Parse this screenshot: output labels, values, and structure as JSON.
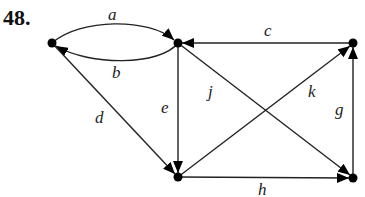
{
  "problem_number": "48.",
  "graph": {
    "type": "directed",
    "nodes": [
      {
        "id": "L",
        "x": 52,
        "y": 43
      },
      {
        "id": "TC",
        "x": 178,
        "y": 43
      },
      {
        "id": "TR",
        "x": 353,
        "y": 43
      },
      {
        "id": "BL",
        "x": 178,
        "y": 177
      },
      {
        "id": "BR",
        "x": 353,
        "y": 178
      }
    ],
    "edges": [
      {
        "label": "a",
        "from": "L",
        "to": "TC",
        "curve": "up"
      },
      {
        "label": "b",
        "from": "TC",
        "to": "L",
        "curve": "down"
      },
      {
        "label": "c",
        "from": "TR",
        "to": "TC"
      },
      {
        "label": "d",
        "from": "L",
        "to": "BL"
      },
      {
        "label": "e",
        "from": "TC",
        "to": "BL"
      },
      {
        "label": "j",
        "from": "TC",
        "to": "BR"
      },
      {
        "label": "k",
        "from": "BL",
        "to": "TR"
      },
      {
        "label": "g",
        "from": "BR",
        "to": "TR"
      },
      {
        "label": "h",
        "from": "BL",
        "to": "BR"
      }
    ]
  },
  "labels": {
    "a": "a",
    "b": "b",
    "c": "c",
    "d": "d",
    "e": "e",
    "j": "j",
    "k": "k",
    "g": "g",
    "h": "h"
  },
  "colors": {
    "stroke": "#222222",
    "node": "#000000",
    "background": "#ffffff"
  }
}
